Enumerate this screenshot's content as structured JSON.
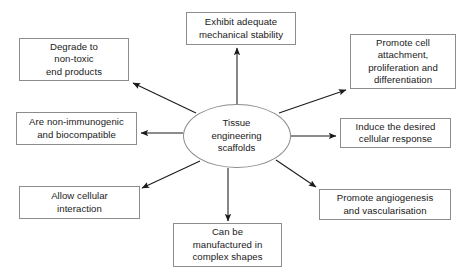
{
  "diagram": {
    "type": "hub-and-spoke",
    "center": {
      "id": "center",
      "label": "Tissue\nengineering\nscaffolds",
      "shape": "ellipse",
      "cx": 236.5,
      "cy": 136,
      "rx": 54,
      "ry": 32
    },
    "nodes": [
      {
        "id": "exhibit-adequate-mechanical-stability",
        "label": "Exhibit adequate\nmechanical stability",
        "x": 186,
        "y": 12,
        "w": 110,
        "h": 33
      },
      {
        "id": "promote-cell-attachment",
        "label": "Promote cell\nattachment,\nproliferation and\ndifferentiation",
        "x": 350,
        "y": 34,
        "w": 106,
        "h": 55
      },
      {
        "id": "degrade-to-non-toxic-end-products",
        "label": "Degrade to\nnon-toxic\nend products",
        "x": 19,
        "y": 38,
        "w": 110,
        "h": 43
      },
      {
        "id": "are-non-immunogenic-and-biocompatible",
        "label": "Are non-immunogenic\nand biocompatible",
        "x": 16,
        "y": 112,
        "w": 121,
        "h": 33
      },
      {
        "id": "induce-the-desired-cellular-response",
        "label": "Induce the desired\ncellular response",
        "x": 340,
        "y": 118,
        "w": 111,
        "h": 30
      },
      {
        "id": "allow-cellular-interaction",
        "label": "Allow cellular\ninteraction",
        "x": 19,
        "y": 186,
        "w": 121,
        "h": 33
      },
      {
        "id": "promote-angiogenesis-and-vascularisation",
        "label": "Promote angiogenesis\nand vascularisation",
        "x": 319,
        "y": 189,
        "w": 132,
        "h": 31
      },
      {
        "id": "can-be-manufactured-in-complex-shapes",
        "label": "Can be\nmanufactured in\ncomplex shapes",
        "x": 173,
        "y": 223,
        "w": 109,
        "h": 44
      }
    ],
    "edges": [
      {
        "id": "edge-to-exhibit-adequate-mechanical-stability",
        "from": "center",
        "to": "exhibit-adequate-mechanical-stability",
        "x1": 237,
        "y1": 104,
        "x2": 237,
        "y2": 48
      },
      {
        "id": "edge-to-promote-cell-attachment",
        "from": "center",
        "to": "promote-cell-attachment",
        "x1": 279,
        "y1": 113,
        "x2": 346,
        "y2": 90
      },
      {
        "id": "edge-to-degrade-to-non-toxic-end-products",
        "from": "center",
        "to": "degrade-to-non-toxic-end-products",
        "x1": 196,
        "y1": 113,
        "x2": 133,
        "y2": 83
      },
      {
        "id": "edge-to-are-non-immunogenic-and-biocompatible",
        "from": "center",
        "to": "are-non-immunogenic-and-biocompatible",
        "x1": 183,
        "y1": 133,
        "x2": 141,
        "y2": 133
      },
      {
        "id": "edge-to-induce-the-desired-cellular-response",
        "from": "center",
        "to": "induce-the-desired-cellular-response",
        "x1": 290,
        "y1": 136,
        "x2": 336,
        "y2": 136
      },
      {
        "id": "edge-to-allow-cellular-interaction",
        "from": "center",
        "to": "allow-cellular-interaction",
        "x1": 200,
        "y1": 161,
        "x2": 142,
        "y2": 188
      },
      {
        "id": "edge-to-promote-angiogenesis-and-vascularisation",
        "from": "center",
        "to": "promote-angiogenesis-and-vascularisation",
        "x1": 276,
        "y1": 160,
        "x2": 316,
        "y2": 187
      },
      {
        "id": "edge-to-can-be-manufactured-in-complex-shapes",
        "from": "center",
        "to": "can-be-manufactured-in-complex-shapes",
        "x1": 228,
        "y1": 168,
        "x2": 228,
        "y2": 221
      }
    ],
    "colors": {
      "background": "#ffffff",
      "box_border": "#8c8c8c",
      "box_fill": "#ffffff",
      "text": "#1a1a1a",
      "arrow": "#1a1a1a"
    }
  }
}
